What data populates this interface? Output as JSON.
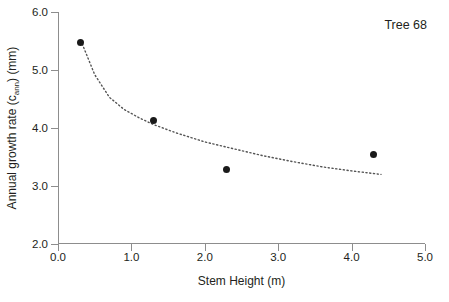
{
  "chart_data": {
    "type": "scatter",
    "title": "",
    "annotation": "Tree 68",
    "xlabel": "Stem Height  (m)",
    "ylabel_main": "Annual growth rate (c",
    "ylabel_sub": "ann",
    "ylabel_tail": ") (mm)",
    "ylabel_plain": "Annual growth rate (c_ann) (mm)",
    "xlim": [
      0.0,
      5.0
    ],
    "ylim": [
      2.0,
      6.0
    ],
    "xticks": [
      "0.0",
      "1.0",
      "2.0",
      "3.0",
      "4.0",
      "5.0"
    ],
    "xtick_values": [
      0.0,
      1.0,
      2.0,
      3.0,
      4.0,
      5.0
    ],
    "yticks": [
      "2.0",
      "3.0",
      "4.0",
      "5.0",
      "6.0"
    ],
    "ytick_values": [
      2.0,
      3.0,
      4.0,
      5.0,
      6.0
    ],
    "grid": false,
    "legend": null,
    "marker_color": "#1a1a1a",
    "trend_color": "#555555",
    "trend_style": "dotted",
    "points": [
      {
        "x": 0.3,
        "y": 5.48
      },
      {
        "x": 1.3,
        "y": 4.13
      },
      {
        "x": 2.3,
        "y": 3.29
      },
      {
        "x": 4.3,
        "y": 3.54
      }
    ],
    "trend_curve": [
      {
        "x": 0.33,
        "y": 5.45
      },
      {
        "x": 0.5,
        "y": 4.92
      },
      {
        "x": 0.7,
        "y": 4.53
      },
      {
        "x": 0.9,
        "y": 4.32
      },
      {
        "x": 1.1,
        "y": 4.18
      },
      {
        "x": 1.3,
        "y": 4.06
      },
      {
        "x": 1.6,
        "y": 3.92
      },
      {
        "x": 2.0,
        "y": 3.76
      },
      {
        "x": 2.4,
        "y": 3.64
      },
      {
        "x": 2.8,
        "y": 3.52
      },
      {
        "x": 3.2,
        "y": 3.42
      },
      {
        "x": 3.6,
        "y": 3.33
      },
      {
        "x": 4.0,
        "y": 3.26
      },
      {
        "x": 4.4,
        "y": 3.2
      }
    ]
  }
}
